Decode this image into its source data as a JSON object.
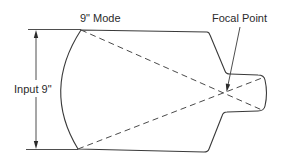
{
  "diagram": {
    "title_label": "9\" Mode",
    "focal_label": "Focal Point",
    "input_label": "Input 9\"",
    "colors": {
      "stroke": "#3a3a3a",
      "text": "#2b2b2b",
      "background": "#ffffff"
    },
    "elements": [
      "image-intensifier-outline",
      "ray-dashed-top-to-bottom",
      "ray-dashed-bottom-to-top",
      "focal-point-leader-arrow",
      "input-dimension-arrow"
    ]
  }
}
